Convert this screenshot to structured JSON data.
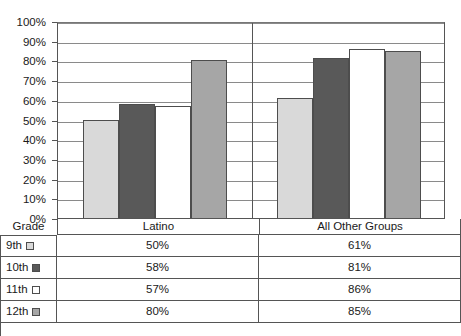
{
  "chart_data": {
    "type": "bar",
    "title": "",
    "xlabel": "",
    "ylabel": "",
    "categories": [
      "Latino",
      "All Other Groups"
    ],
    "series": [
      {
        "name": "9th",
        "swatch_color": "#d9d9d9",
        "values": [
          50,
          58
        ]
      },
      {
        "name": "10th",
        "swatch_color": "#595959",
        "values": [
          58,
          81
        ]
      },
      {
        "name": "11th",
        "swatch_color": "#ffffff",
        "values": [
          57,
          86
        ]
      },
      {
        "name": "12th",
        "swatch_color": "#a6a6a6",
        "values": [
          80,
          85
        ]
      }
    ],
    "series_by_category": {
      "Latino": {
        "9th": 50,
        "10th": 58,
        "11th": 57,
        "12th": 80
      },
      "All Other Groups": {
        "9th": 61,
        "10th": 81,
        "11th": 86,
        "12th": 85
      }
    },
    "ylim": [
      0,
      100
    ],
    "ytick_values": [
      0,
      10,
      20,
      30,
      40,
      50,
      60,
      70,
      80,
      90,
      100
    ],
    "ytick_labels": [
      "0%",
      "10%",
      "20%",
      "30%",
      "40%",
      "50%",
      "60%",
      "70%",
      "80%",
      "90%",
      "100%"
    ],
    "grid": true,
    "legend": "below-in-table",
    "bars": [
      {
        "category": "Latino",
        "series": "9th",
        "value": 50,
        "color": "#d9d9d9"
      },
      {
        "category": "Latino",
        "series": "10th",
        "value": 58,
        "color": "#595959"
      },
      {
        "category": "Latino",
        "series": "11th",
        "value": 57,
        "color": "#ffffff"
      },
      {
        "category": "Latino",
        "series": "12th",
        "value": 80,
        "color": "#a6a6a6"
      },
      {
        "category": "All Other Groups",
        "series": "9th",
        "value": 61,
        "color": "#d9d9d9"
      },
      {
        "category": "All Other Groups",
        "series": "10th",
        "value": 81,
        "color": "#595959"
      },
      {
        "category": "All Other Groups",
        "series": "11th",
        "value": 86,
        "color": "#ffffff"
      },
      {
        "category": "All Other Groups",
        "series": "12th",
        "value": 85,
        "color": "#a6a6a6"
      }
    ]
  },
  "table": {
    "corner_label": "Grade",
    "column_headers": [
      "Latino",
      "All Other Groups"
    ],
    "rows": [
      {
        "grade": "9th",
        "swatch_color": "#d9d9d9",
        "latino": "50%",
        "all_other_groups": "61%"
      },
      {
        "grade": "10th",
        "swatch_color": "#595959",
        "latino": "58%",
        "all_other_groups": "81%"
      },
      {
        "grade": "11th",
        "swatch_color": "#ffffff",
        "latino": "57%",
        "all_other_groups": "86%"
      },
      {
        "grade": "12th",
        "swatch_color": "#a6a6a6",
        "latino": "80%",
        "all_other_groups": "85%"
      }
    ]
  },
  "colors": {
    "axis": "#555555",
    "gridline": "#8a8a8a",
    "bar_outline": "#4d4d4d",
    "text": "#1a1a1a",
    "background": "#ffffff"
  }
}
